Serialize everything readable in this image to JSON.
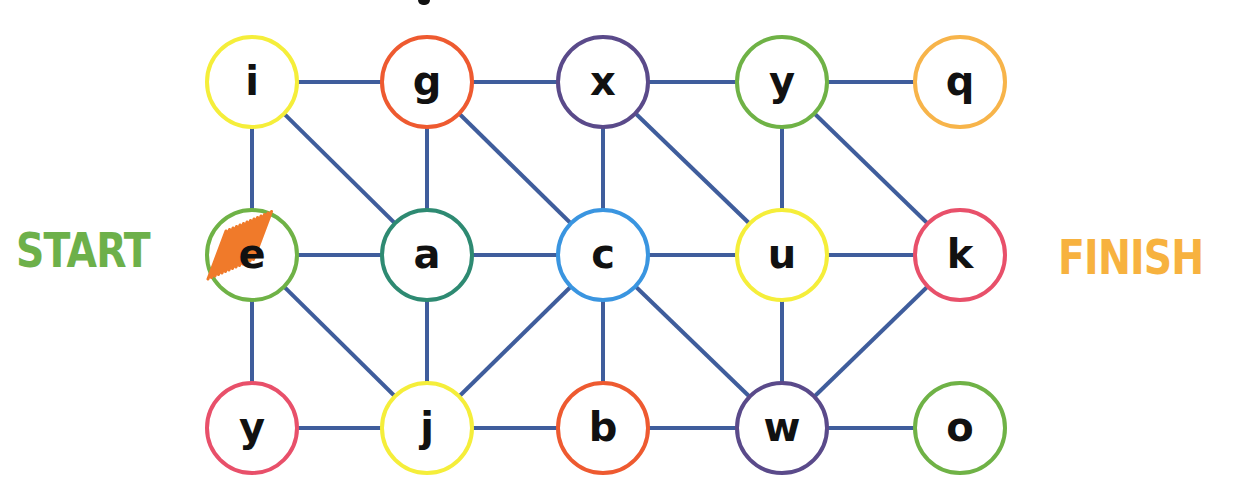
{
  "labels": {
    "start": "START",
    "finish": "FINISH"
  },
  "colors": {
    "edge": "#3f5d9c",
    "start_text": "#6db04a",
    "finish_text": "#f7b23f",
    "scribble": "#f07a2a"
  },
  "nodes": [
    {
      "id": "n0",
      "letter": "i",
      "row": 0,
      "col": 0,
      "ring": "#f5ee3a"
    },
    {
      "id": "n1",
      "letter": "g",
      "row": 0,
      "col": 1,
      "ring": "#ee5a30"
    },
    {
      "id": "n2",
      "letter": "x",
      "row": 0,
      "col": 2,
      "ring": "#5a4a8a"
    },
    {
      "id": "n3",
      "letter": "y",
      "row": 0,
      "col": 3,
      "ring": "#6fb246"
    },
    {
      "id": "n4",
      "letter": "q",
      "row": 0,
      "col": 4,
      "ring": "#f7b44a"
    },
    {
      "id": "n5",
      "letter": "e",
      "row": 1,
      "col": 0,
      "ring": "#6fb246",
      "marked": true
    },
    {
      "id": "n6",
      "letter": "a",
      "row": 1,
      "col": 1,
      "ring": "#2e8a72"
    },
    {
      "id": "n7",
      "letter": "c",
      "row": 1,
      "col": 2,
      "ring": "#3a95e0"
    },
    {
      "id": "n8",
      "letter": "u",
      "row": 1,
      "col": 3,
      "ring": "#f5ee3a"
    },
    {
      "id": "n9",
      "letter": "k",
      "row": 1,
      "col": 4,
      "ring": "#e8506a"
    },
    {
      "id": "n10",
      "letter": "y",
      "row": 2,
      "col": 0,
      "ring": "#e8506a"
    },
    {
      "id": "n11",
      "letter": "j",
      "row": 2,
      "col": 1,
      "ring": "#f5ee3a"
    },
    {
      "id": "n12",
      "letter": "b",
      "row": 2,
      "col": 2,
      "ring": "#ee5a30"
    },
    {
      "id": "n13",
      "letter": "w",
      "row": 2,
      "col": 3,
      "ring": "#5a4a8a"
    },
    {
      "id": "n14",
      "letter": "o",
      "row": 2,
      "col": 4,
      "ring": "#6fb246"
    }
  ],
  "edges": [
    [
      "n0",
      "n1"
    ],
    [
      "n1",
      "n2"
    ],
    [
      "n2",
      "n3"
    ],
    [
      "n3",
      "n4"
    ],
    [
      "n0",
      "n5"
    ],
    [
      "n0",
      "n6"
    ],
    [
      "n1",
      "n6"
    ],
    [
      "n1",
      "n7"
    ],
    [
      "n2",
      "n7"
    ],
    [
      "n2",
      "n8"
    ],
    [
      "n3",
      "n8"
    ],
    [
      "n3",
      "n9"
    ],
    [
      "n5",
      "n6"
    ],
    [
      "n6",
      "n7"
    ],
    [
      "n7",
      "n8"
    ],
    [
      "n8",
      "n9"
    ],
    [
      "n5",
      "n10"
    ],
    [
      "n5",
      "n11"
    ],
    [
      "n6",
      "n11"
    ],
    [
      "n7",
      "n11"
    ],
    [
      "n7",
      "n12"
    ],
    [
      "n7",
      "n13"
    ],
    [
      "n8",
      "n13"
    ],
    [
      "n9",
      "n13"
    ],
    [
      "n10",
      "n11"
    ],
    [
      "n11",
      "n12"
    ],
    [
      "n12",
      "n13"
    ],
    [
      "n13",
      "n14"
    ]
  ],
  "layout": {
    "col_x": [
      252,
      427,
      603,
      782,
      960
    ],
    "row_y": [
      82,
      255,
      428
    ],
    "radius": 45
  }
}
